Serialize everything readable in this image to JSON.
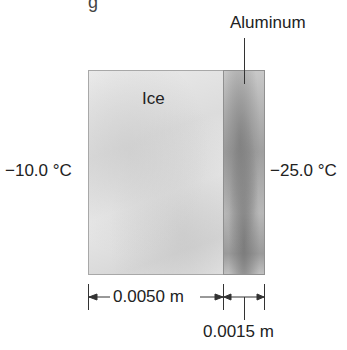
{
  "diagram": {
    "type": "composite wall heat conduction",
    "top_fragment": "g",
    "layers": [
      {
        "name": "Ice",
        "thickness": "0.0050 m",
        "color": "#e2e2e2"
      },
      {
        "name": "Aluminum",
        "thickness": "0.0015 m",
        "color": "#a8a8a8"
      }
    ],
    "left_temperature": "−10.0 °C",
    "right_temperature": "−25.0 °C",
    "dimensions": {
      "ice_thickness": "0.0050 m",
      "aluminum_thickness": "0.0015 m"
    }
  }
}
